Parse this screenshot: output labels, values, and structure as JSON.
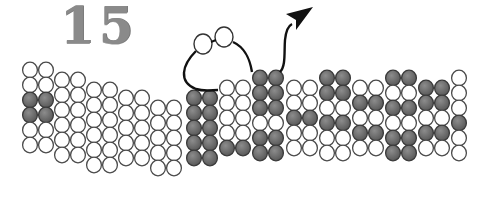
{
  "figure": {
    "number_label": "15",
    "colors": {
      "outline": "#4a4a4a",
      "white_fill": "#ffffff",
      "dark_fill": "#6e6e6e",
      "dark_highlight": "#8c8c8c",
      "line": "#111111",
      "number": "#8a8a8a"
    },
    "circle_diameter": 16,
    "row_pitch": 15,
    "column_groups": [
      {
        "x": 22,
        "top": 62,
        "cols": 2,
        "rows": [
          "W",
          "W",
          "D",
          "D",
          "W",
          "W"
        ]
      },
      {
        "x": 54,
        "top": 72,
        "cols": 2,
        "rows": [
          "W",
          "W",
          "W",
          "W",
          "W",
          "W"
        ]
      },
      {
        "x": 86,
        "top": 82,
        "cols": 2,
        "rows": [
          "W",
          "W",
          "W",
          "W",
          "W",
          "W"
        ]
      },
      {
        "x": 118,
        "top": 90,
        "cols": 2,
        "rows": [
          "W",
          "W",
          "W",
          "W",
          "W"
        ]
      },
      {
        "x": 150,
        "top": 100,
        "cols": 2,
        "rows": [
          "W",
          "W",
          "W",
          "W",
          "W"
        ]
      },
      {
        "x": 186,
        "top": 90,
        "cols": 2,
        "rows": [
          "D",
          "D",
          "D",
          "D",
          "D"
        ]
      },
      {
        "x": 219,
        "top": 80,
        "cols": 2,
        "rows": [
          "W",
          "W",
          "W",
          "W",
          "D"
        ]
      },
      {
        "x": 252,
        "top": 70,
        "cols": 2,
        "rows": [
          "D",
          "D",
          "D",
          "W",
          "D",
          "D"
        ]
      },
      {
        "x": 286,
        "top": 80,
        "cols": 2,
        "rows": [
          "W",
          "W",
          "D",
          "W",
          "W"
        ]
      },
      {
        "x": 319,
        "top": 70,
        "cols": 2,
        "rows": [
          "D",
          "D",
          "W",
          "D",
          "W",
          "W"
        ]
      },
      {
        "x": 352,
        "top": 80,
        "cols": 2,
        "rows": [
          "W",
          "D",
          "W",
          "D",
          "W"
        ]
      },
      {
        "x": 385,
        "top": 70,
        "cols": 2,
        "rows": [
          "D",
          "W",
          "D",
          "W",
          "D",
          "D"
        ]
      },
      {
        "x": 418,
        "top": 80,
        "cols": 2,
        "rows": [
          "D",
          "D",
          "W",
          "D",
          "W"
        ]
      },
      {
        "x": 451,
        "top": 70,
        "cols": 1,
        "rows": [
          "W",
          "W",
          "W",
          "D",
          "W",
          "W"
        ]
      }
    ],
    "loop_molecule": {
      "beads": [
        {
          "cx": 203,
          "cy": 44,
          "r": 9
        },
        {
          "cx": 224,
          "cy": 37,
          "r": 9
        }
      ],
      "path": "M 196 51 C 182 65, 178 82, 196 89 C 205 92, 212 90, 218 90 M 233 42 C 246 48, 250 60, 252 72"
    },
    "exit_arrow": {
      "path": "M 280 72 C 286 66, 284 52, 285 40 C 286 30, 288 26, 292 24",
      "head": "286,14 313,7 296,30 296,20"
    }
  }
}
